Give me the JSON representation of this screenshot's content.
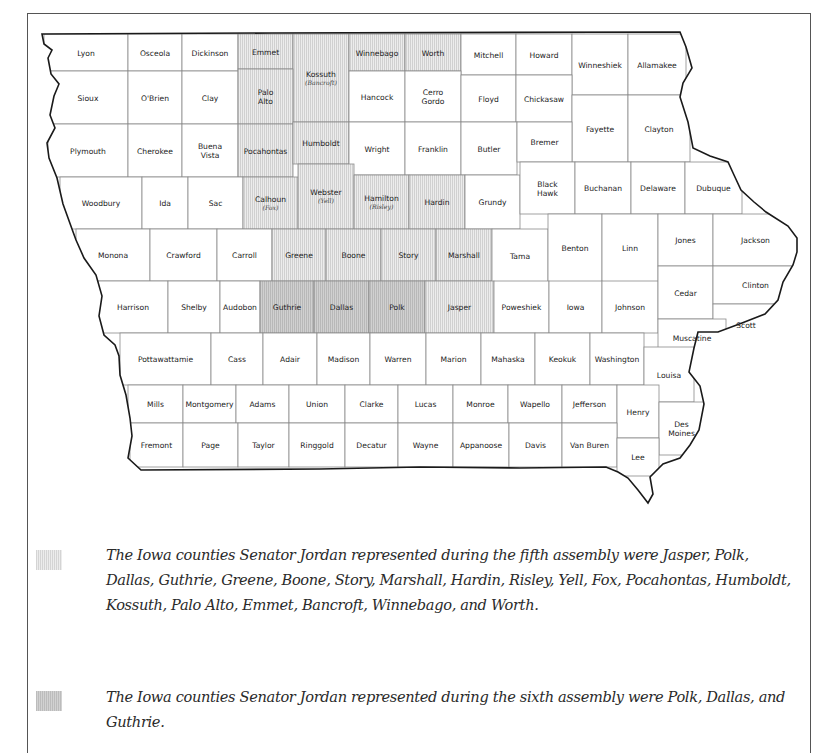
{
  "map": {
    "title": "Iowa counties",
    "colors": {
      "fifth_assembly": "#e0e0e0",
      "sixth_assembly": "#c6c6c6",
      "unshaded": "#ffffff",
      "border": "#222222"
    },
    "counties": [
      {
        "name": "Lyon",
        "x": 44,
        "y": 34,
        "w": 84,
        "h": 37,
        "shade": ""
      },
      {
        "name": "Osceola",
        "x": 128,
        "y": 34,
        "w": 54,
        "h": 37,
        "shade": ""
      },
      {
        "name": "Dickinson",
        "x": 182,
        "y": 34,
        "w": 56,
        "h": 37,
        "shade": ""
      },
      {
        "name": "Emmet",
        "x": 238,
        "y": 34,
        "w": 55,
        "h": 35,
        "shade": "fifth"
      },
      {
        "name": "Kossuth",
        "alt": "(Bancroft)",
        "x": 293,
        "y": 34,
        "w": 56,
        "h": 88,
        "shade": "fifth"
      },
      {
        "name": "Winnebago",
        "x": 349,
        "y": 34,
        "w": 56,
        "h": 37,
        "shade": "fifth"
      },
      {
        "name": "Worth",
        "x": 405,
        "y": 34,
        "w": 56,
        "h": 37,
        "shade": "fifth"
      },
      {
        "name": "Mitchell",
        "x": 461,
        "y": 34,
        "w": 55,
        "h": 41,
        "shade": ""
      },
      {
        "name": "Howard",
        "x": 516,
        "y": 34,
        "w": 56,
        "h": 41,
        "shade": ""
      },
      {
        "name": "Winneshiek",
        "x": 572,
        "y": 34,
        "w": 56,
        "h": 61,
        "shade": ""
      },
      {
        "name": "Allamakee",
        "x": 628,
        "y": 34,
        "w": 58,
        "h": 61,
        "shade": ""
      },
      {
        "name": "Sioux",
        "x": 48,
        "y": 71,
        "w": 80,
        "h": 53,
        "shade": ""
      },
      {
        "name": "O'Brien",
        "x": 128,
        "y": 71,
        "w": 54,
        "h": 53,
        "shade": ""
      },
      {
        "name": "Clay",
        "x": 182,
        "y": 71,
        "w": 56,
        "h": 53,
        "shade": ""
      },
      {
        "name": "Palo Alto",
        "x": 238,
        "y": 69,
        "w": 55,
        "h": 55,
        "shade": "fifth"
      },
      {
        "name": "Hancock",
        "x": 349,
        "y": 71,
        "w": 56,
        "h": 51,
        "shade": ""
      },
      {
        "name": "Cerro Gordo",
        "x": 405,
        "y": 71,
        "w": 56,
        "h": 51,
        "shade": ""
      },
      {
        "name": "Floyd",
        "x": 461,
        "y": 75,
        "w": 55,
        "h": 47,
        "shade": ""
      },
      {
        "name": "Chickasaw",
        "x": 516,
        "y": 75,
        "w": 56,
        "h": 47,
        "shade": ""
      },
      {
        "name": "Fayette",
        "x": 572,
        "y": 95,
        "w": 56,
        "h": 67,
        "shade": ""
      },
      {
        "name": "Clayton",
        "x": 628,
        "y": 95,
        "w": 62,
        "h": 67,
        "shade": ""
      },
      {
        "name": "Plymouth",
        "x": 48,
        "y": 124,
        "w": 80,
        "h": 53,
        "shade": ""
      },
      {
        "name": "Cherokee",
        "x": 128,
        "y": 124,
        "w": 54,
        "h": 53,
        "shade": ""
      },
      {
        "name": "Buena Vista",
        "x": 182,
        "y": 124,
        "w": 56,
        "h": 53,
        "shade": ""
      },
      {
        "name": "Pocahontas",
        "x": 238,
        "y": 124,
        "w": 55,
        "h": 53,
        "shade": "fifth"
      },
      {
        "name": "Humboldt",
        "x": 293,
        "y": 122,
        "w": 56,
        "h": 42,
        "shade": "fifth"
      },
      {
        "name": "Wright",
        "x": 349,
        "y": 122,
        "w": 56,
        "h": 53,
        "shade": ""
      },
      {
        "name": "Franklin",
        "x": 405,
        "y": 122,
        "w": 56,
        "h": 53,
        "shade": ""
      },
      {
        "name": "Butler",
        "x": 461,
        "y": 122,
        "w": 56,
        "h": 53,
        "shade": ""
      },
      {
        "name": "Bremer",
        "x": 517,
        "y": 122,
        "w": 55,
        "h": 40,
        "shade": ""
      },
      {
        "name": "Woodbury",
        "x": 60,
        "y": 177,
        "w": 82,
        "h": 52,
        "shade": ""
      },
      {
        "name": "Ida",
        "x": 142,
        "y": 177,
        "w": 46,
        "h": 52,
        "shade": ""
      },
      {
        "name": "Sac",
        "x": 188,
        "y": 177,
        "w": 55,
        "h": 52,
        "shade": ""
      },
      {
        "name": "Calhoun",
        "alt": "(Fox)",
        "x": 243,
        "y": 177,
        "w": 55,
        "h": 52,
        "shade": "fifth"
      },
      {
        "name": "Webster",
        "alt": "(Yell)",
        "x": 298,
        "y": 164,
        "w": 56,
        "h": 65,
        "shade": "fifth"
      },
      {
        "name": "Hamilton",
        "alt": "(Risley)",
        "x": 354,
        "y": 175,
        "w": 55,
        "h": 54,
        "shade": "fifth"
      },
      {
        "name": "Hardin",
        "x": 409,
        "y": 175,
        "w": 56,
        "h": 54,
        "shade": "fifth"
      },
      {
        "name": "Grundy",
        "x": 465,
        "y": 175,
        "w": 55,
        "h": 54,
        "shade": ""
      },
      {
        "name": "Black Hawk",
        "x": 520,
        "y": 162,
        "w": 55,
        "h": 52,
        "shade": ""
      },
      {
        "name": "Buchanan",
        "x": 575,
        "y": 162,
        "w": 56,
        "h": 52,
        "shade": ""
      },
      {
        "name": "Delaware",
        "x": 631,
        "y": 162,
        "w": 54,
        "h": 52,
        "shade": ""
      },
      {
        "name": "Dubuque",
        "x": 685,
        "y": 162,
        "w": 57,
        "h": 52,
        "shade": ""
      },
      {
        "name": "Monona",
        "x": 76,
        "y": 229,
        "w": 74,
        "h": 52,
        "shade": ""
      },
      {
        "name": "Crawford",
        "x": 150,
        "y": 229,
        "w": 67,
        "h": 52,
        "shade": ""
      },
      {
        "name": "Carroll",
        "x": 217,
        "y": 229,
        "w": 55,
        "h": 52,
        "shade": ""
      },
      {
        "name": "Greene",
        "x": 272,
        "y": 229,
        "w": 54,
        "h": 52,
        "shade": "fifth"
      },
      {
        "name": "Boone",
        "x": 326,
        "y": 229,
        "w": 55,
        "h": 52,
        "shade": "fifth"
      },
      {
        "name": "Story",
        "x": 381,
        "y": 229,
        "w": 55,
        "h": 52,
        "shade": "fifth"
      },
      {
        "name": "Marshall",
        "x": 436,
        "y": 229,
        "w": 56,
        "h": 52,
        "shade": "fifth"
      },
      {
        "name": "Tama",
        "x": 492,
        "y": 229,
        "w": 56,
        "h": 53,
        "shade": ""
      },
      {
        "name": "Benton",
        "x": 548,
        "y": 214,
        "w": 54,
        "h": 68,
        "shade": ""
      },
      {
        "name": "Linn",
        "x": 602,
        "y": 214,
        "w": 56,
        "h": 68,
        "shade": ""
      },
      {
        "name": "Jones",
        "x": 658,
        "y": 214,
        "w": 55,
        "h": 52,
        "shade": ""
      },
      {
        "name": "Jackson",
        "x": 713,
        "y": 214,
        "w": 85,
        "h": 52,
        "shade": ""
      },
      {
        "name": "Harrison",
        "x": 98,
        "y": 281,
        "w": 70,
        "h": 52,
        "shade": ""
      },
      {
        "name": "Shelby",
        "x": 168,
        "y": 281,
        "w": 52,
        "h": 52,
        "shade": ""
      },
      {
        "name": "Audobon",
        "x": 220,
        "y": 281,
        "w": 40,
        "h": 52,
        "shade": ""
      },
      {
        "name": "Guthrie",
        "x": 260,
        "y": 281,
        "w": 54,
        "h": 52,
        "shade": "sixth"
      },
      {
        "name": "Dallas",
        "x": 314,
        "y": 281,
        "w": 55,
        "h": 52,
        "shade": "sixth"
      },
      {
        "name": "Polk",
        "x": 369,
        "y": 281,
        "w": 56,
        "h": 52,
        "shade": "sixth"
      },
      {
        "name": "Jasper",
        "x": 425,
        "y": 281,
        "w": 69,
        "h": 52,
        "shade": "fifth"
      },
      {
        "name": "Poweshiek",
        "x": 494,
        "y": 281,
        "w": 55,
        "h": 52,
        "shade": ""
      },
      {
        "name": "Iowa",
        "x": 549,
        "y": 281,
        "w": 53,
        "h": 52,
        "shade": ""
      },
      {
        "name": "Johnson",
        "x": 602,
        "y": 281,
        "w": 56,
        "h": 52,
        "shade": ""
      },
      {
        "name": "Cedar",
        "x": 658,
        "y": 266,
        "w": 55,
        "h": 53,
        "shade": ""
      },
      {
        "name": "Clinton",
        "x": 713,
        "y": 266,
        "w": 85,
        "h": 38,
        "shade": ""
      },
      {
        "name": "Scott",
        "x": 713,
        "y": 304,
        "w": 66,
        "h": 42,
        "shade": ""
      },
      {
        "name": "Muscatine",
        "x": 658,
        "y": 319,
        "w": 68,
        "h": 38,
        "shade": ""
      },
      {
        "name": "Pottawattamie",
        "x": 120,
        "y": 333,
        "w": 91,
        "h": 52,
        "shade": ""
      },
      {
        "name": "Cass",
        "x": 211,
        "y": 333,
        "w": 52,
        "h": 52,
        "shade": ""
      },
      {
        "name": "Adair",
        "x": 263,
        "y": 333,
        "w": 54,
        "h": 52,
        "shade": ""
      },
      {
        "name": "Madison",
        "x": 317,
        "y": 333,
        "w": 53,
        "h": 52,
        "shade": ""
      },
      {
        "name": "Warren",
        "x": 370,
        "y": 333,
        "w": 56,
        "h": 52,
        "shade": ""
      },
      {
        "name": "Marion",
        "x": 426,
        "y": 333,
        "w": 55,
        "h": 52,
        "shade": ""
      },
      {
        "name": "Mahaska",
        "x": 481,
        "y": 333,
        "w": 54,
        "h": 52,
        "shade": ""
      },
      {
        "name": "Keokuk",
        "x": 535,
        "y": 333,
        "w": 55,
        "h": 52,
        "shade": ""
      },
      {
        "name": "Washington",
        "x": 590,
        "y": 333,
        "w": 54,
        "h": 52,
        "shade": ""
      },
      {
        "name": "Louisa",
        "x": 644,
        "y": 347,
        "w": 50,
        "h": 55,
        "shade": ""
      },
      {
        "name": "Mills",
        "x": 128,
        "y": 385,
        "w": 55,
        "h": 38,
        "shade": ""
      },
      {
        "name": "Montgomery",
        "x": 183,
        "y": 385,
        "w": 53,
        "h": 38,
        "shade": ""
      },
      {
        "name": "Adams",
        "x": 236,
        "y": 385,
        "w": 53,
        "h": 38,
        "shade": ""
      },
      {
        "name": "Union",
        "x": 289,
        "y": 385,
        "w": 56,
        "h": 38,
        "shade": ""
      },
      {
        "name": "Clarke",
        "x": 345,
        "y": 385,
        "w": 53,
        "h": 38,
        "shade": ""
      },
      {
        "name": "Lucas",
        "x": 398,
        "y": 385,
        "w": 55,
        "h": 38,
        "shade": ""
      },
      {
        "name": "Monroe",
        "x": 453,
        "y": 385,
        "w": 55,
        "h": 38,
        "shade": ""
      },
      {
        "name": "Wapello",
        "x": 508,
        "y": 385,
        "w": 54,
        "h": 38,
        "shade": ""
      },
      {
        "name": "Jefferson",
        "x": 562,
        "y": 385,
        "w": 55,
        "h": 38,
        "shade": ""
      },
      {
        "name": "Henry",
        "x": 617,
        "y": 385,
        "w": 42,
        "h": 53,
        "shade": ""
      },
      {
        "name": "Des Moines",
        "x": 659,
        "y": 402,
        "w": 45,
        "h": 53,
        "shade": ""
      },
      {
        "name": "Fremont",
        "x": 130,
        "y": 423,
        "w": 53,
        "h": 44,
        "shade": ""
      },
      {
        "name": "Page",
        "x": 183,
        "y": 423,
        "w": 55,
        "h": 44,
        "shade": ""
      },
      {
        "name": "Taylor",
        "x": 238,
        "y": 423,
        "w": 51,
        "h": 44,
        "shade": ""
      },
      {
        "name": "Ringgold",
        "x": 289,
        "y": 423,
        "w": 56,
        "h": 44,
        "shade": ""
      },
      {
        "name": "Decatur",
        "x": 345,
        "y": 423,
        "w": 53,
        "h": 44,
        "shade": ""
      },
      {
        "name": "Wayne",
        "x": 398,
        "y": 423,
        "w": 55,
        "h": 44,
        "shade": ""
      },
      {
        "name": "Appanoose",
        "x": 453,
        "y": 423,
        "w": 56,
        "h": 44,
        "shade": ""
      },
      {
        "name": "Davis",
        "x": 509,
        "y": 423,
        "w": 53,
        "h": 44,
        "shade": ""
      },
      {
        "name": "Van Buren",
        "x": 562,
        "y": 423,
        "w": 55,
        "h": 44,
        "shade": ""
      },
      {
        "name": "Lee",
        "x": 617,
        "y": 438,
        "w": 42,
        "h": 38,
        "shade": ""
      }
    ]
  },
  "legend": {
    "fifth": {
      "swatch": "fifth-assembly-pattern",
      "text": "The Iowa counties Senator Jordan represented during the fifth assembly were Jasper, Polk, Dallas, Guthrie, Greene, Boone, Story, Marshall, Hardin, Risley, Yell, Fox, Pocahontas, Humboldt, Kossuth, Palo Alto, Emmet, Bancroft, Winnebago, and Worth."
    },
    "sixth": {
      "swatch": "sixth-assembly-pattern",
      "text": "The Iowa counties Senator Jordan represented during the sixth assembly were Polk, Dallas, and Guthrie."
    }
  }
}
